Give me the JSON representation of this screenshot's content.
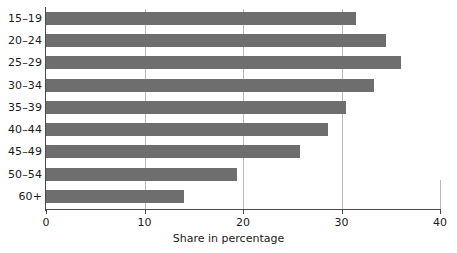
{
  "chart_data": {
    "type": "bar",
    "orientation": "horizontal",
    "title": "",
    "xlabel": "Share in percentage",
    "ylabel": "",
    "categories": [
      "15–19",
      "20–24",
      "25–29",
      "30–34",
      "35–39",
      "40–44",
      "45–49",
      "50–54",
      "60+"
    ],
    "values": [
      31.5,
      34.5,
      36.0,
      33.3,
      30.5,
      28.6,
      25.8,
      19.4,
      14.0
    ],
    "xlim": [
      0,
      40
    ],
    "xticks": [
      0,
      10,
      20,
      30,
      40
    ],
    "xtick_labels": [
      "0",
      "10",
      "20",
      "30",
      "40"
    ],
    "gridlines": [
      10,
      20,
      30
    ],
    "grid": true,
    "legend": null,
    "bar_color": "#6e6e6e",
    "axis_color": "#4a4a4a",
    "grid_color": "#b9b9b9",
    "background": "#ffffff"
  }
}
